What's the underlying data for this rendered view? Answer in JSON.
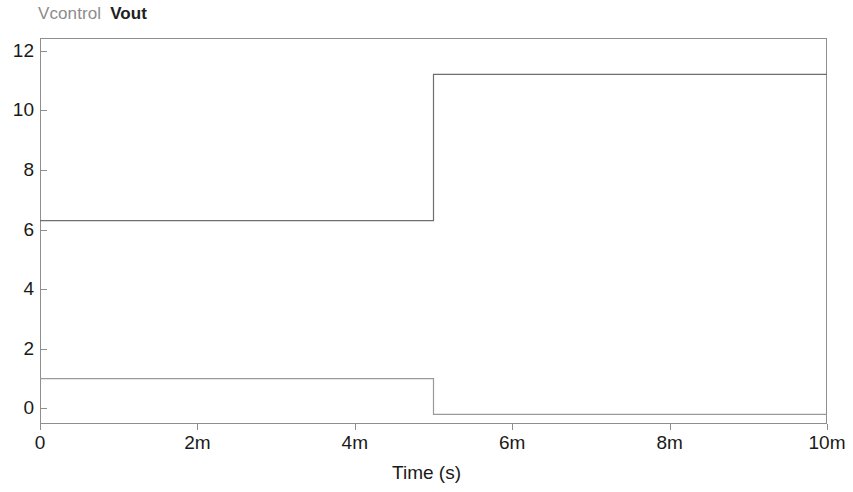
{
  "chart_data": {
    "type": "line",
    "title": "",
    "xlabel": "Time (s)",
    "ylabel": "",
    "grid": false,
    "legend_position": "top-left",
    "xlim": [
      0,
      0.01
    ],
    "ylim": [
      -0.52,
      12.42
    ],
    "x_tick_values": [
      0,
      0.002,
      0.004,
      0.006,
      0.008,
      0.01
    ],
    "x_tick_labels": [
      "0",
      "2m",
      "4m",
      "6m",
      "8m",
      "10m"
    ],
    "y_tick_values": [
      0,
      2,
      4,
      6,
      8,
      10,
      12
    ],
    "y_tick_labels": [
      "0",
      "2",
      "4",
      "6",
      "8",
      "10",
      "12"
    ],
    "step_time": 0.005,
    "series": [
      {
        "name": "Vcontrol",
        "color": "#9a9a9a",
        "style": "step",
        "x": [
          0,
          0.005,
          0.005,
          0.01
        ],
        "values": [
          1.0,
          1.0,
          -0.2,
          -0.2
        ],
        "level_before": 1.0,
        "level_after": -0.2
      },
      {
        "name": "Vout",
        "color": "#6e6e6e",
        "style": "step",
        "x": [
          0,
          0.005,
          0.005,
          0.01
        ],
        "values": [
          6.3,
          6.3,
          11.2,
          11.2
        ],
        "level_before": 6.3,
        "level_after": 11.2
      }
    ]
  },
  "legend": {
    "entries": [
      {
        "label": "Vcontrol",
        "color": "#8c8c8c"
      },
      {
        "label": "Vout",
        "color": "#202020"
      }
    ]
  },
  "axes": {
    "x_title": "Time (s)",
    "x_ticks": [
      "0",
      "2m",
      "4m",
      "6m",
      "8m",
      "10m"
    ],
    "y_ticks": [
      "12",
      "10",
      "8",
      "6",
      "4",
      "2",
      "0"
    ]
  },
  "colors": {
    "frame": "#8e8e8e",
    "background": "#ffffff",
    "text": "#1a1a1a",
    "series_vcontrol": "#9a9a9a",
    "series_vout": "#6e6e6e"
  }
}
